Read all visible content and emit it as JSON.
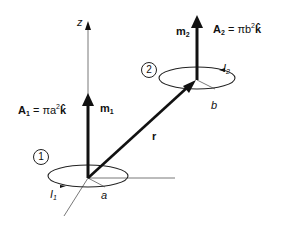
{
  "diagram": {
    "axis_label_z": "z",
    "loop1": {
      "number": "1",
      "area_lhs": "A",
      "area_sub": "1",
      "area_eq": " = πa",
      "area_exp": "2",
      "area_unit": "k̂",
      "moment": "m",
      "moment_sub": "1",
      "current": "I",
      "current_sub": "1",
      "radius": "a"
    },
    "loop2": {
      "number": "2",
      "area_lhs": "A",
      "area_sub": "2",
      "area_eq": " = πb",
      "area_exp": "2",
      "area_unit": "k̂",
      "moment": "m",
      "moment_sub": "2",
      "current": "I",
      "current_sub": "2",
      "radius": "b"
    },
    "separation_vector": "r",
    "colors": {
      "stroke": "#111111",
      "axis": "#555555",
      "background": "#ffffff"
    }
  }
}
